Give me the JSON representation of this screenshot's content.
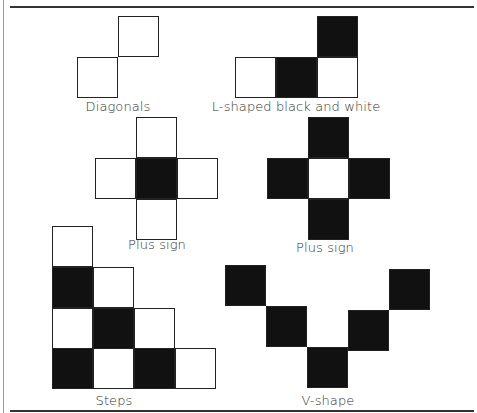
{
  "figure": {
    "cell_size": 41,
    "colors": {
      "black": "#111111",
      "white": "#ffffff",
      "border": "#222222",
      "text": "#333333"
    },
    "patterns": [
      {
        "name": "diagonals",
        "label": "Diagonals",
        "label_pos": [
          118,
          99
        ],
        "cells": [
          {
            "x": 118,
            "y": 16,
            "fill": "w"
          },
          {
            "x": 77,
            "y": 57,
            "fill": "w"
          }
        ]
      },
      {
        "name": "l-shaped",
        "label": "L-shaped black and white",
        "label_pos": [
          296,
          99
        ],
        "cells": [
          {
            "x": 317,
            "y": 16,
            "fill": "b"
          },
          {
            "x": 235,
            "y": 57,
            "fill": "w"
          },
          {
            "x": 276,
            "y": 57,
            "fill": "b"
          },
          {
            "x": 317,
            "y": 57,
            "fill": "w"
          }
        ]
      },
      {
        "name": "plus-sign-white",
        "label": "Plus sign",
        "label_pos": [
          157,
          237
        ],
        "cells": [
          {
            "x": 136,
            "y": 117,
            "fill": "w"
          },
          {
            "x": 95,
            "y": 158,
            "fill": "w"
          },
          {
            "x": 136,
            "y": 158,
            "fill": "b"
          },
          {
            "x": 177,
            "y": 158,
            "fill": "w"
          },
          {
            "x": 136,
            "y": 199,
            "fill": "w"
          }
        ]
      },
      {
        "name": "plus-sign-black",
        "label": "Plus sign",
        "label_pos": [
          325,
          240
        ],
        "cells": [
          {
            "x": 308,
            "y": 117,
            "fill": "b"
          },
          {
            "x": 267,
            "y": 158,
            "fill": "b"
          },
          {
            "x": 308,
            "y": 158,
            "fill": "w"
          },
          {
            "x": 349,
            "y": 158,
            "fill": "b"
          },
          {
            "x": 308,
            "y": 199,
            "fill": "b"
          }
        ]
      },
      {
        "name": "steps",
        "label": "Steps",
        "label_pos": [
          114,
          393
        ],
        "cells": [
          {
            "x": 52,
            "y": 226,
            "fill": "w"
          },
          {
            "x": 52,
            "y": 267,
            "fill": "b"
          },
          {
            "x": 93,
            "y": 267,
            "fill": "w"
          },
          {
            "x": 52,
            "y": 308,
            "fill": "w"
          },
          {
            "x": 93,
            "y": 308,
            "fill": "b"
          },
          {
            "x": 134,
            "y": 308,
            "fill": "w"
          },
          {
            "x": 52,
            "y": 348,
            "fill": "b"
          },
          {
            "x": 93,
            "y": 348,
            "fill": "w"
          },
          {
            "x": 134,
            "y": 348,
            "fill": "b"
          },
          {
            "x": 175,
            "y": 348,
            "fill": "w"
          }
        ]
      },
      {
        "name": "v-shape",
        "label": "V-shape",
        "label_pos": [
          328,
          393
        ],
        "cells": [
          {
            "x": 225,
            "y": 265,
            "fill": "b"
          },
          {
            "x": 266,
            "y": 306,
            "fill": "b"
          },
          {
            "x": 307,
            "y": 347,
            "fill": "b"
          },
          {
            "x": 348,
            "y": 310,
            "fill": "b"
          },
          {
            "x": 389,
            "y": 269,
            "fill": "b"
          }
        ]
      }
    ]
  }
}
